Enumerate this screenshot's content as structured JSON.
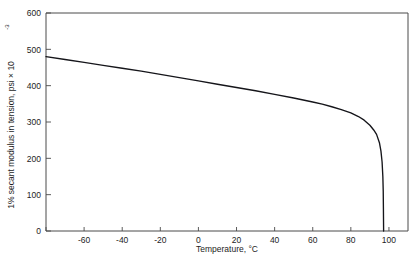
{
  "chart_data": {
    "type": "line",
    "title": "",
    "xlabel": "Temperature, °C",
    "ylabel": "1% secant modulus in tension, psi × 10⁻³",
    "ylabel_main": "1% secant modulus in tension, psi",
    "ylabel_mult": "× 10",
    "ylabel_exp": "-3",
    "xlim": [
      -80,
      110
    ],
    "ylim": [
      0,
      600
    ],
    "grid": false,
    "legend": "none",
    "xticks": [
      -80,
      -60,
      -40,
      -20,
      0,
      20,
      40,
      60,
      80,
      100
    ],
    "xticklabels": [
      "",
      "-60",
      "-40",
      "-20",
      "0",
      "20",
      "40",
      "60",
      "80",
      "100"
    ],
    "yticks": [
      0,
      100,
      200,
      300,
      400,
      500,
      600
    ],
    "yticklabels": [
      "0",
      "100",
      "200",
      "300",
      "400",
      "500",
      "600"
    ],
    "series": [
      {
        "name": "1% secant modulus",
        "color": "#15151a",
        "x": [
          -80,
          -70,
          -60,
          -50,
          -40,
          -30,
          -20,
          -10,
          0,
          10,
          20,
          30,
          40,
          50,
          60,
          65,
          70,
          75,
          80,
          84,
          87,
          90,
          92,
          93.5,
          95,
          95.8,
          96.4,
          96.8,
          97,
          97.1,
          97.2
        ],
        "y": [
          480,
          472,
          464,
          456,
          448,
          440,
          431,
          422,
          413,
          404,
          395,
          386,
          376,
          366,
          355,
          349,
          342,
          334,
          325,
          315,
          305,
          291,
          278,
          266,
          243,
          220,
          190,
          150,
          110,
          60,
          0
        ]
      }
    ]
  }
}
